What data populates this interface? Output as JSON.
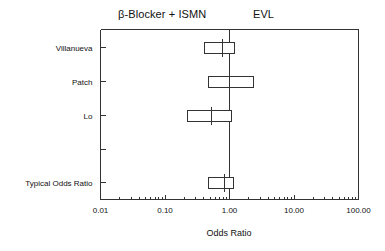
{
  "figure": {
    "kind": "forest-plot",
    "header_left": "β-Blocker + ISMN",
    "header_right": "EVL",
    "axis_title": "Odds Ratio",
    "stroke_color": "#333333",
    "box_fill": "#ffffff",
    "background": "#ffffff"
  },
  "chart_data": {
    "type": "bar",
    "title": "β-Blocker + ISMN            EVL",
    "subtitle": "",
    "xlabel": "Odds Ratio",
    "ylabel": "",
    "xscale": "log",
    "xlim": [
      0.01,
      100.0
    ],
    "xticks": [
      0.01,
      0.1,
      1.0,
      10.0,
      100.0
    ],
    "xticklabels": [
      "0.01",
      "0.10",
      "1.00",
      "10.00",
      "100.00"
    ],
    "grid": false,
    "legend": "none",
    "null_line": 1.0,
    "favors_left_label": "β-Blocker + ISMN",
    "favors_right_label": "EVL",
    "categories": [
      "Villanueva",
      "Patch",
      "Lo",
      "",
      "Typical Odds Ratio"
    ],
    "studies": [
      {
        "label": "Villanueva",
        "odds_ratio": 0.78,
        "ci_low": 0.41,
        "ci_high": 1.19,
        "row": 0,
        "is_summary": false
      },
      {
        "label": "Patch",
        "odds_ratio": 1.0,
        "ci_low": 0.48,
        "ci_high": 2.35,
        "row": 1,
        "is_summary": false
      },
      {
        "label": "Lo",
        "odds_ratio": 0.52,
        "ci_low": 0.22,
        "ci_high": 1.08,
        "row": 2,
        "is_summary": false
      },
      {
        "label": "",
        "odds_ratio": null,
        "ci_low": null,
        "ci_high": null,
        "row": 3,
        "is_summary": false
      },
      {
        "label": "Typical Odds Ratio",
        "odds_ratio": 0.83,
        "ci_low": 0.48,
        "ci_high": 1.15,
        "row": 4,
        "is_summary": true
      }
    ]
  }
}
